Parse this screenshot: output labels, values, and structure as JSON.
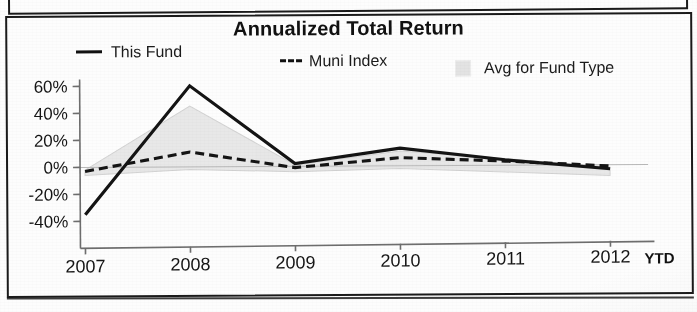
{
  "chart_data": {
    "type": "line",
    "title": "Annualized Total Return",
    "xlabel": "",
    "ylabel": "",
    "categories": [
      "2007",
      "2008",
      "2009",
      "2010",
      "2011",
      "2012"
    ],
    "x_axis_suffix": "YTD",
    "ylim": [
      -40,
      60
    ],
    "y_ticks": [
      60,
      40,
      20,
      0,
      -20,
      -40
    ],
    "y_tick_labels": [
      "60%",
      "40%",
      "20%",
      "0%",
      "-20%",
      "-40%"
    ],
    "grid": false,
    "legend_position": "top",
    "series": [
      {
        "name": "This Fund",
        "style": "solid",
        "color": "#141414",
        "values": [
          -35,
          60,
          2,
          13,
          4,
          -3
        ]
      },
      {
        "name": "Muni Index",
        "style": "dashed",
        "color": "#141414",
        "values": [
          -3,
          11,
          -1,
          6,
          3,
          -1
        ]
      },
      {
        "name": "Avg for Fund Type",
        "style": "band",
        "color": "#e6e6e6",
        "upper": [
          -2,
          45,
          1,
          11,
          5,
          -2
        ],
        "lower": [
          -6,
          -2,
          -4,
          -2,
          -5,
          -8
        ]
      }
    ]
  },
  "chart": {
    "title": "Annualized Total Return",
    "legend": [
      {
        "label": "This Fund",
        "marker": "solid-line-swatch"
      },
      {
        "label": "Muni Index",
        "marker": "dashed-line-swatch"
      },
      {
        "label": "Avg for Fund Type",
        "marker": "gray-box-swatch"
      }
    ],
    "y_axis": {
      "labels": [
        "60%",
        "40%",
        "20%",
        "0%",
        "-20%",
        "-40%"
      ]
    },
    "x_axis": {
      "labels": [
        "2007",
        "2008",
        "2009",
        "2010",
        "2011",
        "2012"
      ],
      "suffix": "YTD"
    }
  },
  "colors": {
    "line": "#141414",
    "band_fill": "#e6e6e6",
    "band_stroke": "#cfcfcf",
    "axis": "#6e6e6e",
    "frame": "#1a1a1a",
    "text": "#151515",
    "page_background": "#fdfdfd"
  }
}
